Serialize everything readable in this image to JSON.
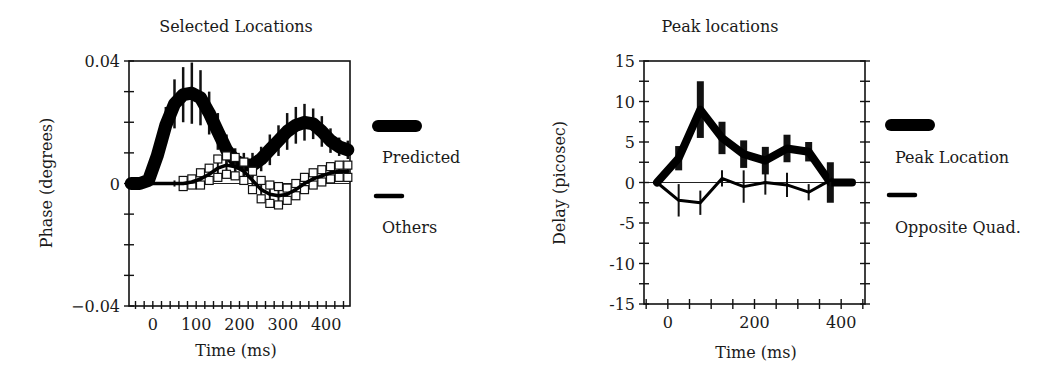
{
  "chart_data": [
    {
      "type": "line",
      "title": "Selected Locations",
      "xlabel": "Time (ms)",
      "ylabel": "Phase (degrees)",
      "xlim": [
        -55,
        455
      ],
      "ylim": [
        -0.04,
        0.04
      ],
      "xticks": [
        0,
        100,
        200,
        300,
        400
      ],
      "xtick_labels": [
        "0",
        "100",
        "200",
        "300",
        "400"
      ],
      "xminor_step": 20,
      "yticks": [
        -0.04,
        0,
        0.04
      ],
      "ytick_labels": [
        "−0.04",
        "0",
        "0.04"
      ],
      "yminor_step": 0.01,
      "zero_line": true,
      "grid": false,
      "legend_position": "right",
      "series": [
        {
          "name": "Predicted",
          "style": "thick",
          "x": [
            -50,
            -30,
            -10,
            10,
            30,
            50,
            70,
            90,
            110,
            130,
            150,
            170,
            190,
            210,
            230,
            250,
            270,
            290,
            310,
            330,
            350,
            370,
            390,
            410,
            430,
            450
          ],
          "values": [
            0.0,
            0.0,
            0.001,
            0.009,
            0.019,
            0.026,
            0.029,
            0.0295,
            0.028,
            0.023,
            0.017,
            0.011,
            0.0075,
            0.006,
            0.006,
            0.008,
            0.011,
            0.014,
            0.017,
            0.019,
            0.02,
            0.0195,
            0.017,
            0.014,
            0.012,
            0.011
          ],
          "error": [
            0,
            0,
            0,
            0.004,
            0.006,
            0.008,
            0.009,
            0.01,
            0.009,
            0.007,
            0.006,
            0.005,
            0.004,
            0.004,
            0.004,
            0.004,
            0.005,
            0.005,
            0.006,
            0.006,
            0.006,
            0.005,
            0.005,
            0.004,
            0.003,
            0.003
          ]
        },
        {
          "name": "Others",
          "style": "thin-with-squares",
          "x": [
            -50,
            -30,
            -10,
            10,
            30,
            50,
            70,
            90,
            110,
            130,
            150,
            170,
            190,
            210,
            230,
            250,
            270,
            290,
            310,
            330,
            350,
            370,
            390,
            410,
            430,
            450
          ],
          "values": [
            0.0,
            0.0,
            0.0,
            0.0,
            0.0,
            0.0,
            0.0,
            0.0005,
            0.0015,
            0.003,
            0.005,
            0.006,
            0.0055,
            0.004,
            0.001,
            -0.002,
            -0.0035,
            -0.004,
            -0.0035,
            -0.002,
            0.0,
            0.0015,
            0.0025,
            0.0035,
            0.004,
            0.004
          ],
          "error": [
            0,
            0,
            0,
            0,
            0,
            0.001,
            0.001,
            0.001,
            0.002,
            0.002,
            0.003,
            0.003,
            0.003,
            0.003,
            0.003,
            0.003,
            0.003,
            0.003,
            0.002,
            0.002,
            0.002,
            0.002,
            0.002,
            0.002,
            0.002,
            0.002
          ]
        }
      ]
    },
    {
      "type": "line",
      "title": "Peak locations",
      "xlabel": "Time (ms)",
      "ylabel": "Delay (picosec)",
      "xlim": [
        -55,
        455
      ],
      "ylim": [
        -15,
        15
      ],
      "xticks": [
        0,
        200,
        400
      ],
      "xtick_labels": [
        "0",
        "200",
        "400"
      ],
      "xminor_step": 50,
      "yticks": [
        -15,
        -10,
        -5,
        0,
        5,
        10,
        15
      ],
      "ytick_labels": [
        "-15",
        "-10",
        "-5",
        "0",
        "5",
        "10",
        "15"
      ],
      "yminor_step": 2.5,
      "zero_line": true,
      "grid": false,
      "legend_position": "right",
      "series": [
        {
          "name": "Peak Location",
          "style": "thick",
          "x": [
            -25,
            25,
            75,
            125,
            175,
            225,
            275,
            325,
            375,
            425
          ],
          "values": [
            0,
            3,
            9,
            5.5,
            3.5,
            2.7,
            4.2,
            3.8,
            0,
            0
          ],
          "error": [
            0,
            1.5,
            3.5,
            2,
            1.7,
            1.7,
            1.7,
            1.2,
            2.5,
            0
          ]
        },
        {
          "name": "Opposite Quad.",
          "style": "thin",
          "x": [
            -25,
            25,
            75,
            125,
            175,
            225,
            275,
            325,
            375,
            425
          ],
          "values": [
            0,
            -2.2,
            -2.5,
            0.5,
            -0.5,
            0,
            -0.3,
            -1.2,
            0.3,
            0
          ],
          "error": [
            0,
            2,
            1.5,
            1,
            2,
            1.5,
            1.5,
            1,
            1,
            0
          ]
        }
      ]
    }
  ],
  "panels": [
    {
      "frame": {
        "left": 129,
        "top": 61,
        "right": 350,
        "bottom": 306
      },
      "title_pos": [
        236,
        32
      ],
      "legend": {
        "x": 372,
        "items_y": [
          126,
          196
        ],
        "label_y": [
          163,
          233
        ]
      }
    },
    {
      "frame": {
        "left": 644,
        "top": 61,
        "right": 865,
        "bottom": 304
      },
      "title_pos": [
        720,
        32
      ],
      "legend": {
        "x": 885,
        "items_y": [
          125,
          195
        ],
        "label_y": [
          163,
          233
        ]
      }
    }
  ]
}
